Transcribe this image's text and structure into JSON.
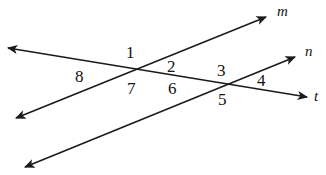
{
  "diagram": {
    "kind": "two-transversals-crossing-diagram",
    "background_color": "#ffffff",
    "stroke_color": "#1a1a1a",
    "lines": [
      {
        "id": "line-m",
        "label": "m",
        "label_x": 277,
        "label_y": 4,
        "x1": 16,
        "y1": 118,
        "x2": 266,
        "y2": 17,
        "arrow_start": true,
        "arrow_end": true
      },
      {
        "id": "line-n",
        "label": "n",
        "label_x": 305,
        "label_y": 44,
        "x1": 25,
        "y1": 167,
        "x2": 295,
        "y2": 57,
        "arrow_start": true,
        "arrow_end": true
      },
      {
        "id": "line-t",
        "label": "t",
        "label_x": 314,
        "label_y": 89,
        "x1": 8,
        "y1": 48,
        "x2": 307,
        "y2": 97,
        "arrow_start": true,
        "arrow_end": true
      }
    ],
    "intersections": [
      {
        "id": "left-vertex",
        "x": 133,
        "y": 71
      },
      {
        "id": "right-vertex",
        "x": 224,
        "y": 86
      }
    ],
    "angle_labels": [
      {
        "id": "angle-1",
        "text": "1",
        "x": 126,
        "y": 44
      },
      {
        "id": "angle-2",
        "text": "2",
        "x": 167,
        "y": 58
      },
      {
        "id": "angle-3",
        "text": "3",
        "x": 217,
        "y": 62
      },
      {
        "id": "angle-4",
        "text": "4",
        "x": 257,
        "y": 72
      },
      {
        "id": "angle-5",
        "text": "5",
        "x": 218,
        "y": 91
      },
      {
        "id": "angle-6",
        "text": "6",
        "x": 168,
        "y": 80
      },
      {
        "id": "angle-7",
        "text": "7",
        "x": 127,
        "y": 80
      },
      {
        "id": "angle-8",
        "text": "8",
        "x": 75,
        "y": 68
      }
    ]
  }
}
